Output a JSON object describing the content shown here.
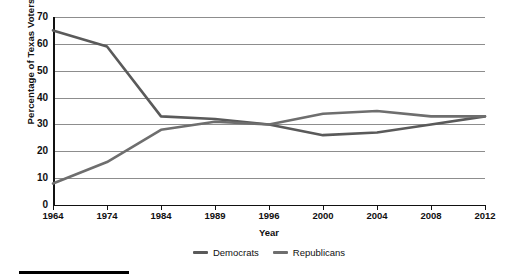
{
  "chart_data": {
    "type": "line",
    "title": "",
    "xlabel": "Year",
    "ylabel": "Percentage of Texas Voters",
    "categories": [
      "1964",
      "1974",
      "1984",
      "1989",
      "1996",
      "2000",
      "2004",
      "2008",
      "2012"
    ],
    "x": [
      1964,
      1974,
      1984,
      1989,
      1996,
      2000,
      2004,
      2008,
      2012
    ],
    "series": [
      {
        "name": "Democrats",
        "color": "#5a5a5a",
        "values": [
          65,
          59,
          33,
          32,
          30,
          26,
          27,
          30,
          33
        ]
      },
      {
        "name": "Republicans",
        "color": "#6e6e6e",
        "values": [
          8,
          16,
          28,
          31,
          30,
          34,
          35,
          33,
          33
        ]
      }
    ],
    "ylim": [
      0,
      70
    ],
    "yticks": [
      0,
      10,
      20,
      30,
      40,
      50,
      60,
      70
    ],
    "ytick_labels": [
      "0",
      "10",
      "20",
      "30",
      "40",
      "50",
      "60",
      "70"
    ],
    "grid": true,
    "grid_color": "#8d8d8d",
    "legend_position": "bottom",
    "axis_color": "#111111",
    "background": "#ffffff"
  },
  "legend": {
    "items": [
      {
        "label": "Democrats"
      },
      {
        "label": "Republicans"
      }
    ]
  },
  "footer": {
    "rule_color": "#000000"
  }
}
